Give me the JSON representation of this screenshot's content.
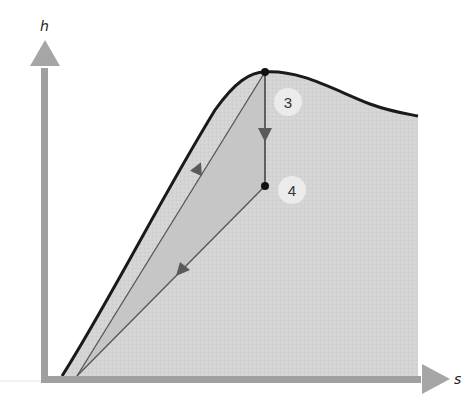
{
  "diagram": {
    "type": "h-s diagram (enthalpy-entropy / Mollier) with cycle path",
    "axes": {
      "y_label": "h",
      "x_label": "s"
    },
    "states": [
      {
        "id": "3",
        "label": "3",
        "x": 265,
        "y": 72
      },
      {
        "id": "4",
        "label": "4",
        "x": 265,
        "y": 186
      }
    ],
    "paths": [
      {
        "name": "expansion-3-to-4",
        "from": "3",
        "to": "4",
        "direction": "down"
      },
      {
        "name": "heat-rejection-4-to-origin",
        "from": "4",
        "to": "bottom",
        "direction": "down-left"
      },
      {
        "name": "compression-heating-to-3",
        "from": "bottom",
        "to": "3",
        "direction": "up-right"
      }
    ],
    "colors": {
      "axis": "#a0a0a0",
      "dome_fill": "#d6d6d6",
      "cycle_fill": "#c4c4c4",
      "dome_outline": "#1a1a1a",
      "path_line": "#555555",
      "arrow": "#5a5a5a",
      "label_circle": "#ebebeb"
    }
  }
}
